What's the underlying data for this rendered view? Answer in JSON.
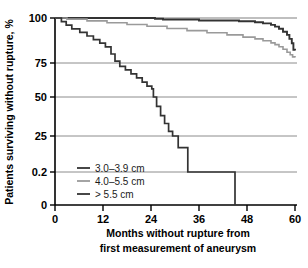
{
  "chart_data": {
    "type": "line",
    "title": "",
    "subtitle": "",
    "xlabel_line1": "Months without rupture from",
    "xlabel_line2": "first measurement of aneurysm",
    "ylabel": "Patients surviving without rupture, %",
    "xlim": [
      0,
      60
    ],
    "ylim": [
      0,
      100
    ],
    "xticks": [
      0,
      12,
      24,
      36,
      48,
      60
    ],
    "xtick_labels": [
      "0",
      "12",
      "24",
      "36",
      "48",
      "60"
    ],
    "yticks": [
      0,
      0.2,
      25,
      50,
      75,
      100
    ],
    "ytick_labels": [
      "0",
      "0.2",
      "25",
      "50",
      "75",
      "100"
    ],
    "grid": "horizontal",
    "grid_color": "#808080",
    "legend_position": "lower-left-inside",
    "step_style": "post",
    "series": [
      {
        "name": "3.0–3.9 cm",
        "color": "#333333",
        "width": 1.9,
        "x": [
          0,
          21,
          25,
          27,
          31,
          36,
          41,
          46,
          50,
          52,
          54,
          55,
          56,
          57,
          58,
          58.6,
          59.2,
          59.6,
          60
        ],
        "values": [
          100,
          100,
          99.6,
          99.2,
          99.2,
          98.6,
          98.6,
          98.2,
          97.6,
          97.0,
          96.2,
          95.2,
          94.0,
          92.4,
          90.6,
          88.4,
          86.0,
          82.4,
          82.0
        ]
      },
      {
        "name": "4.0–5.5 cm",
        "color": "#9a9a9a",
        "width": 1.6,
        "x": [
          0,
          3,
          8,
          13,
          18,
          23,
          28,
          33,
          38,
          43,
          47,
          50,
          52,
          54,
          55,
          56,
          57,
          58,
          58.8,
          59.4,
          60
        ],
        "values": [
          100,
          99.4,
          98.4,
          97.4,
          96.4,
          95.4,
          94.2,
          93.0,
          91.8,
          90.6,
          89.4,
          88.4,
          87.4,
          86.2,
          85.2,
          84.0,
          82.6,
          81.0,
          79.6,
          78.4,
          78.0
        ]
      },
      {
        "name": "> 5.5 cm",
        "color": "#333333",
        "width": 1.7,
        "x": [
          0,
          1.6,
          2.8,
          4.2,
          6.2,
          8.0,
          9.6,
          11.2,
          12.6,
          14.0,
          15.0,
          16.2,
          17.6,
          19.0,
          20.4,
          21.8,
          23.0,
          24.2,
          24.6,
          25.4,
          26.4,
          27.4,
          28.4,
          29.4,
          30.8,
          33.2,
          45.0,
          45.0
        ],
        "values": [
          100,
          98.0,
          96.0,
          94.0,
          92.0,
          90.0,
          88.0,
          86.0,
          84.0,
          80.0,
          76.0,
          72.5,
          70.0,
          67.0,
          64.0,
          61.0,
          58.0,
          56.0,
          50.0,
          44.0,
          38.0,
          33.0,
          28.0,
          25.0,
          17.0,
          0.2,
          0.2,
          0
        ]
      }
    ],
    "annotations": {
      "y_axis_has_break": true,
      "break_note": "0.2 tick placed between 25 and 0 on a non-linear axis"
    }
  },
  "legend": {
    "items": [
      {
        "label": "3.0–3.9 cm",
        "color": "#333333"
      },
      {
        "label": "4.0–5.5 cm",
        "color": "#9a9a9a"
      },
      {
        "label": "> 5.5 cm",
        "color": "#333333"
      }
    ]
  }
}
